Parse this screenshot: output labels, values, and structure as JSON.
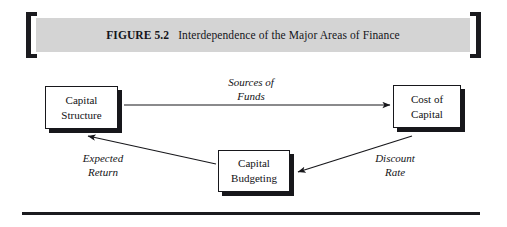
{
  "figure": {
    "label": "FIGURE 5.2",
    "title": "Interdependence of the Major Areas of Finance",
    "banner_color": "#d4d4d4",
    "bracket_color": "#1b1b1f",
    "rule_color": "#1b1b1f"
  },
  "diagram": {
    "nodes": [
      {
        "id": "capital-structure",
        "line1": "Capital",
        "line2": "Structure"
      },
      {
        "id": "cost-of-capital",
        "line1": "Cost of",
        "line2": "Capital"
      },
      {
        "id": "capital-budgeting",
        "line1": "Capital",
        "line2": "Budgeting"
      }
    ],
    "edges": [
      {
        "id": "sources-of-funds",
        "from": "capital-structure",
        "to": "cost-of-capital",
        "line1": "Sources of",
        "line2": "Funds"
      },
      {
        "id": "discount-rate",
        "from": "cost-of-capital",
        "to": "capital-budgeting",
        "line1": "Discount",
        "line2": "Rate"
      },
      {
        "id": "expected-return",
        "from": "capital-budgeting",
        "to": "capital-structure",
        "line1": "Expected",
        "line2": "Return"
      }
    ]
  }
}
